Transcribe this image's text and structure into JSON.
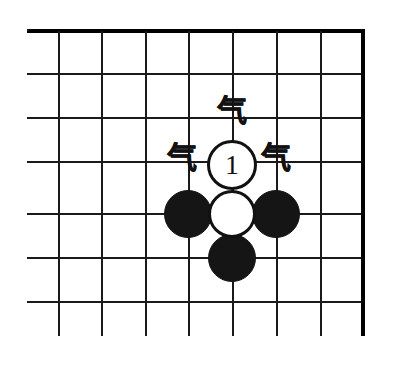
{
  "figure": {
    "type": "go-board-diagram",
    "title": "",
    "board": {
      "columns": 8,
      "rows": 7,
      "line_color": "#1a1a1a",
      "background": "#ffffff",
      "edge_top": true,
      "edge_left": true,
      "edge_right": true,
      "edge_bottom": false
    },
    "stones": [
      {
        "id": "white-move-1",
        "color": "white",
        "label": "1",
        "col": 5,
        "row": 4
      },
      {
        "id": "white-stone-center",
        "color": "white",
        "label": "",
        "col": 5,
        "row": 5
      },
      {
        "id": "black-stone-left",
        "color": "black",
        "label": "",
        "col": 4,
        "row": 5
      },
      {
        "id": "black-stone-right",
        "color": "black",
        "label": "",
        "col": 6,
        "row": 5
      },
      {
        "id": "black-stone-below",
        "color": "black",
        "label": "",
        "col": 5,
        "row": 6
      }
    ],
    "annotations": [
      {
        "id": "qi-top",
        "text": "气",
        "position": "above-move"
      },
      {
        "id": "qi-left",
        "text": "气",
        "position": "left-of-move"
      },
      {
        "id": "qi-right",
        "text": "气",
        "position": "right-of-move"
      }
    ]
  }
}
